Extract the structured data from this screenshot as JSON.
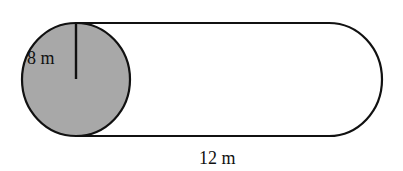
{
  "diagram": {
    "labels": {
      "radius": "8 m",
      "length": "12 m"
    },
    "colors": {
      "end_face_fill": "#a8a8a8",
      "stroke": "#111111",
      "background": "#ffffff"
    }
  }
}
